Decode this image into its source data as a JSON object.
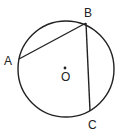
{
  "diagram": {
    "type": "circle-geometry",
    "circle": {
      "center": "O",
      "cx": 66,
      "cy": 69,
      "r": 48
    },
    "points": {
      "A": {
        "label": "A",
        "x": 19,
        "y": 59
      },
      "B": {
        "label": "B",
        "x": 86,
        "y": 23
      },
      "C": {
        "label": "C",
        "x": 90,
        "y": 111
      },
      "O": {
        "label": "O",
        "x": 65,
        "y": 69
      }
    },
    "chords": [
      [
        "A",
        "B"
      ],
      [
        "B",
        "C"
      ]
    ],
    "colors": {
      "stroke": "#222222",
      "background": "#ffffff"
    }
  }
}
